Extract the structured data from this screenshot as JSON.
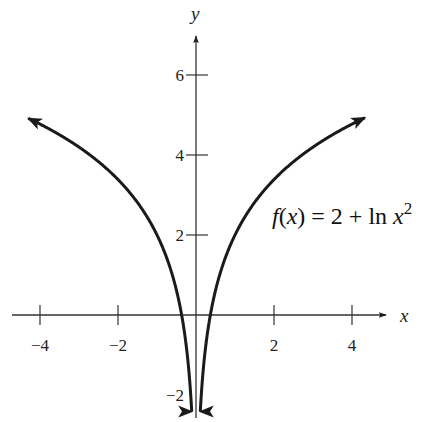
{
  "chart_data": {
    "type": "line",
    "title": "",
    "xlabel": "x",
    "ylabel": "y",
    "xlim": [
      -4.6,
      4.9
    ],
    "ylim": [
      -2.6,
      7.1
    ],
    "x_ticks": [
      -4,
      -2,
      2,
      4
    ],
    "x_tick_labels": [
      "−4",
      "−2",
      "2",
      "4"
    ],
    "y_ticks": [
      6,
      4,
      2,
      -2
    ],
    "y_tick_labels": [
      "6",
      "4",
      "2",
      "−2"
    ],
    "grid": false,
    "annotation": {
      "text_parts": [
        "f(x) = 2 + ln x",
        "2"
      ],
      "label": "f(x) = 2 + ln x²",
      "position": [
        2.0,
        2.5
      ]
    },
    "series": [
      {
        "name": "f(x) = 2 + ln x²",
        "function": "2 + ln(x^2)",
        "branches": [
          {
            "x_range": [
              -4.3,
              -0.11
            ],
            "end_arrows": true
          },
          {
            "x_range": [
              0.11,
              4.33
            ],
            "end_arrows": true
          }
        ],
        "sample_points": [
          {
            "x": -4.3,
            "y": 4.92
          },
          {
            "x": -4,
            "y": 4.77
          },
          {
            "x": -3,
            "y": 4.2
          },
          {
            "x": -2,
            "y": 3.39
          },
          {
            "x": -1,
            "y": 2.0
          },
          {
            "x": -0.5,
            "y": 0.61
          },
          {
            "x": -0.37,
            "y": 0.0
          },
          {
            "x": -0.2,
            "y": -1.22
          },
          {
            "x": -0.11,
            "y": -2.41
          },
          {
            "x": 0.11,
            "y": -2.41
          },
          {
            "x": 0.2,
            "y": -1.22
          },
          {
            "x": 0.37,
            "y": 0.0
          },
          {
            "x": 0.5,
            "y": 0.61
          },
          {
            "x": 1,
            "y": 2.0
          },
          {
            "x": 2,
            "y": 3.39
          },
          {
            "x": 3,
            "y": 4.2
          },
          {
            "x": 4,
            "y": 4.77
          },
          {
            "x": 4.33,
            "y": 4.93
          }
        ]
      }
    ],
    "asymptote": {
      "type": "vertical",
      "x": 0,
      "note": "curve approaches -infinity at x=0"
    }
  },
  "labels": {
    "x_axis": "x",
    "y_axis": "y",
    "formula_main": "f(x) = 2 + ln x",
    "formula_exp": "2"
  }
}
